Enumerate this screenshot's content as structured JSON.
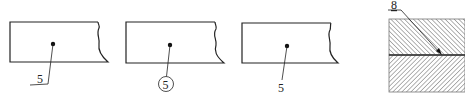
{
  "figure": {
    "colors": {
      "line": "#222222",
      "hatch": "#555555",
      "background": "#ffffff"
    },
    "views": [
      {
        "id": "a",
        "leader_style": "underline",
        "label": "5"
      },
      {
        "id": "b",
        "leader_style": "circle",
        "label": "5"
      },
      {
        "id": "c",
        "leader_style": "plain",
        "label": "5"
      },
      {
        "id": "d",
        "leader_style": "arrow-to-interface",
        "label": "8"
      }
    ]
  }
}
